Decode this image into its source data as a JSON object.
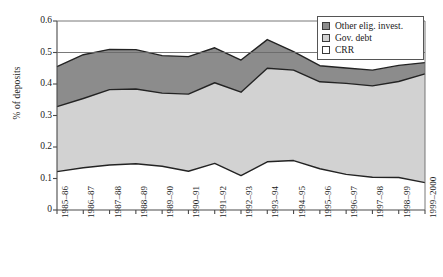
{
  "chart_data": {
    "type": "area",
    "stacked": true,
    "title": "",
    "xlabel": "",
    "ylabel": "% of deposits",
    "ylim": [
      0,
      0.6
    ],
    "yticks": [
      0,
      0.1,
      0.2,
      0.3,
      0.4,
      0.5,
      0.6
    ],
    "ytick_labels": [
      "0",
      "0.1",
      "0.2",
      "0.3",
      "0.4",
      "0.5",
      "0.6"
    ],
    "grid": false,
    "legend_position": "top-right",
    "categories": [
      "1985–86",
      "1986–87",
      "1987–88",
      "1988–89",
      "1989–90",
      "1990–91",
      "1991–92",
      "1992–93",
      "1993–94",
      "1994–95",
      "1995–96",
      "1996–97",
      "1997–98",
      "1998–99",
      "1999–2000"
    ],
    "series": [
      {
        "name": "CRR",
        "color": "#ffffff",
        "values": [
          0.122,
          0.134,
          0.143,
          0.147,
          0.139,
          0.123,
          0.148,
          0.109,
          0.153,
          0.157,
          0.131,
          0.113,
          0.104,
          0.103,
          0.087
        ]
      },
      {
        "name": "Gov. debt",
        "color": "#d2d2d2",
        "values": [
          0.206,
          0.22,
          0.239,
          0.237,
          0.232,
          0.245,
          0.256,
          0.265,
          0.297,
          0.287,
          0.276,
          0.289,
          0.29,
          0.305,
          0.345
        ]
      },
      {
        "name": "Other elig. invest.",
        "color": "#8c8c8c",
        "values": [
          0.127,
          0.139,
          0.128,
          0.125,
          0.119,
          0.119,
          0.111,
          0.102,
          0.091,
          0.059,
          0.051,
          0.049,
          0.05,
          0.051,
          0.036
        ]
      }
    ],
    "cumulative_boundaries": {
      "crr_top": [
        0.122,
        0.134,
        0.143,
        0.147,
        0.139,
        0.123,
        0.148,
        0.109,
        0.153,
        0.157,
        0.131,
        0.113,
        0.104,
        0.103,
        0.087
      ],
      "gov_debt_top": [
        0.328,
        0.354,
        0.382,
        0.384,
        0.371,
        0.368,
        0.404,
        0.374,
        0.45,
        0.444,
        0.407,
        0.402,
        0.394,
        0.408,
        0.432
      ],
      "other_top": [
        0.455,
        0.493,
        0.51,
        0.509,
        0.49,
        0.487,
        0.515,
        0.476,
        0.541,
        0.503,
        0.458,
        0.451,
        0.444,
        0.459,
        0.468
      ]
    }
  },
  "legend": {
    "items": [
      {
        "label": "Other elig. invest.",
        "color": "#8c8c8c"
      },
      {
        "label": "Gov. debt",
        "color": "#d2d2d2"
      },
      {
        "label": "CRR",
        "color": "#ffffff"
      }
    ]
  },
  "axes": {
    "y_title": "% of deposits"
  }
}
